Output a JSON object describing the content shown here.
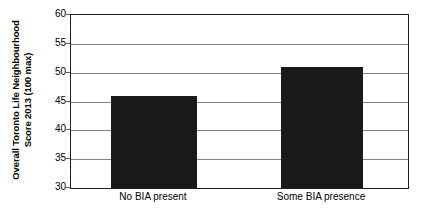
{
  "chart_data": {
    "type": "bar",
    "title": "",
    "xlabel": "",
    "ylabel": "Overall Toronto Life Neighbourhood Score 2013 (100 max)",
    "ylabel_line1": "Overall Toronto Life Neighbourhood",
    "ylabel_line2": "Score 2013 (100 max)",
    "categories": [
      "No BIA present",
      "Some BIA presence"
    ],
    "values": [
      46,
      51
    ],
    "ylim": [
      30,
      60
    ],
    "yticks": [
      60,
      55,
      50,
      45,
      40,
      35,
      30
    ],
    "ytick_labels": [
      "60",
      "55",
      "50",
      "45",
      "40",
      "35",
      "30"
    ],
    "grid": true,
    "grid_axis": "y",
    "legend": false,
    "legend_position": "none",
    "bar_color": "#1a1a1a",
    "axis_color": "#231f20",
    "grid_color": "#808285",
    "background_color": "#ffffff"
  }
}
